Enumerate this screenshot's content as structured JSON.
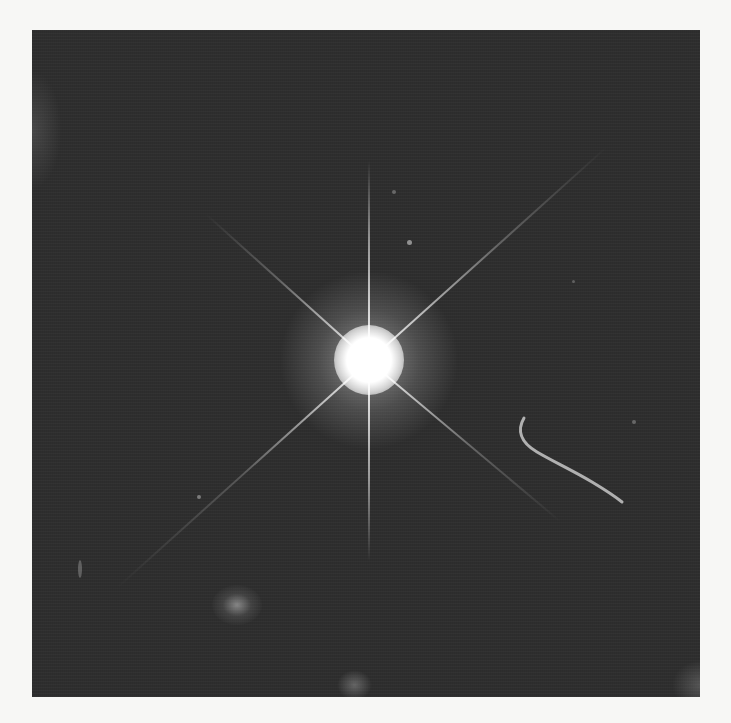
{
  "image": {
    "subject": "Bright star-like point source with eight diffraction spikes on dark sky background",
    "background_color": "#2e2e2e",
    "page_color": "#f7f7f5",
    "features": [
      {
        "name": "central-source",
        "x": 337,
        "y": 330
      },
      {
        "name": "jet-filament",
        "x": 490,
        "y": 390
      },
      {
        "name": "faint-galaxy",
        "x": 200,
        "y": 570
      },
      {
        "name": "faint-smudge-bottom",
        "x": 320,
        "y": 655
      }
    ]
  }
}
